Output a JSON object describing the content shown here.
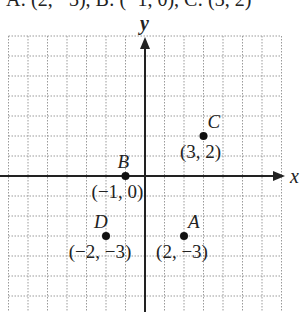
{
  "caption": "A: (2, −3), B: (−1, 0), C: (3, 2)",
  "axes": {
    "x_label": "x",
    "y_label": "y"
  },
  "grid": {
    "x_min": -7,
    "x_max": 7,
    "y_min": -6,
    "y_max": 7,
    "origin_px": [
      145,
      176
    ],
    "unit_x_px": 19.5,
    "unit_y_px": 20
  },
  "colors": {
    "axis": "#222222",
    "grid": "#9a9a9a",
    "point": "#111111",
    "text": "#222222"
  },
  "points": [
    {
      "name": "A",
      "x": 2,
      "y": -3,
      "label": "(2, −3)"
    },
    {
      "name": "B",
      "x": -1,
      "y": 0,
      "label": "(−1, 0)"
    },
    {
      "name": "C",
      "x": 3,
      "y": 2,
      "label": "(3, 2)"
    },
    {
      "name": "D",
      "x": -2,
      "y": -3,
      "label": "(−2, −3)"
    }
  ]
}
